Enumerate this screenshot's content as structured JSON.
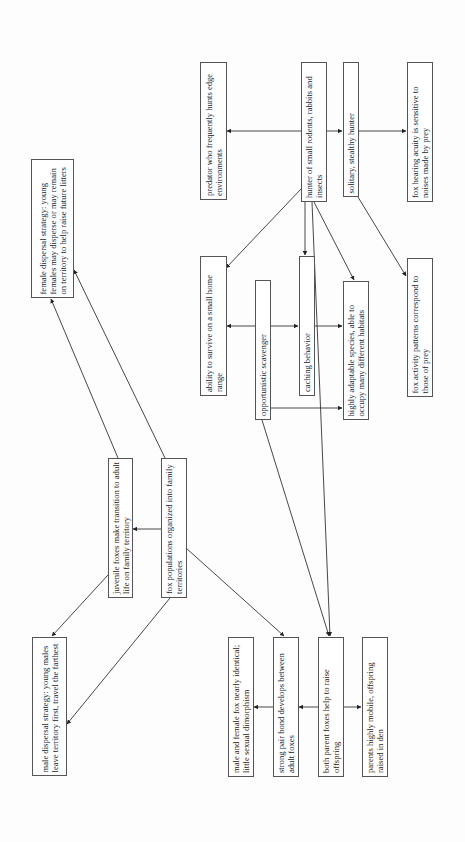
{
  "diagram": {
    "orientation": "rotated -90deg (reads bottom-to-top)",
    "nodes": [
      {
        "id": "predator",
        "label": "predator who frequently hunts edge environments"
      },
      {
        "id": "hunter",
        "label": "hunter of small rodents, rabbits and insects"
      },
      {
        "id": "solitary",
        "label": "solitary, stealthy hunter"
      },
      {
        "id": "hearing",
        "label": "fox hearing acuity is sensitive to noises made by prey"
      },
      {
        "id": "homerange",
        "label": "ability to survive on a small home range"
      },
      {
        "id": "scavenger",
        "label": "opportunistic scavenger"
      },
      {
        "id": "caching",
        "label": "caching behavior"
      },
      {
        "id": "adaptable",
        "label": "highly adaptable species, able to occupy many different habitats"
      },
      {
        "id": "activity",
        "label": "fox activity patterns correspond to those of prey"
      },
      {
        "id": "female",
        "label": "female dispersal strategy: young females may disperse or may remain on territory to help raise future litters"
      },
      {
        "id": "juvenile",
        "label": "juvenile foxes make transition to adult life on family territory"
      },
      {
        "id": "territories",
        "label": "fox populations organized into family territories"
      },
      {
        "id": "male",
        "label": "male dispersal strategy: young males leave territory first, travel the farthest"
      },
      {
        "id": "dimorphism",
        "label": "male and female fox nearly identical; little sexual dimorphism"
      },
      {
        "id": "pairbond",
        "label": "strong pair bond develops between adult foxes"
      },
      {
        "id": "bothparents",
        "label": "both parent foxes help to raise offspring"
      },
      {
        "id": "mobile",
        "label": "parents highly mobile, offspring raised in den"
      }
    ],
    "edges": [
      {
        "from": "hunter",
        "to": "predator"
      },
      {
        "from": "hunter",
        "to": "solitary"
      },
      {
        "from": "solitary",
        "to": "hearing"
      },
      {
        "from": "hunter",
        "to": "homerange"
      },
      {
        "from": "hunter",
        "to": "caching"
      },
      {
        "from": "hunter",
        "to": "adaptable"
      },
      {
        "from": "hunter",
        "to": "bothparents"
      },
      {
        "from": "solitary",
        "to": "activity"
      },
      {
        "from": "scavenger",
        "to": "homerange"
      },
      {
        "from": "scavenger",
        "to": "caching"
      },
      {
        "from": "scavenger",
        "to": "adaptable"
      },
      {
        "from": "scavenger",
        "to": "bothparents"
      },
      {
        "from": "caching",
        "to": "adaptable"
      },
      {
        "from": "territories",
        "to": "juvenile"
      },
      {
        "from": "juvenile",
        "to": "female"
      },
      {
        "from": "territories",
        "to": "female"
      },
      {
        "from": "juvenile",
        "to": "male"
      },
      {
        "from": "territories",
        "to": "male"
      },
      {
        "from": "territories",
        "to": "pairbond"
      },
      {
        "from": "bothparents",
        "to": "pairbond"
      },
      {
        "from": "pairbond",
        "to": "dimorphism"
      },
      {
        "from": "bothparents",
        "to": "mobile"
      }
    ]
  }
}
